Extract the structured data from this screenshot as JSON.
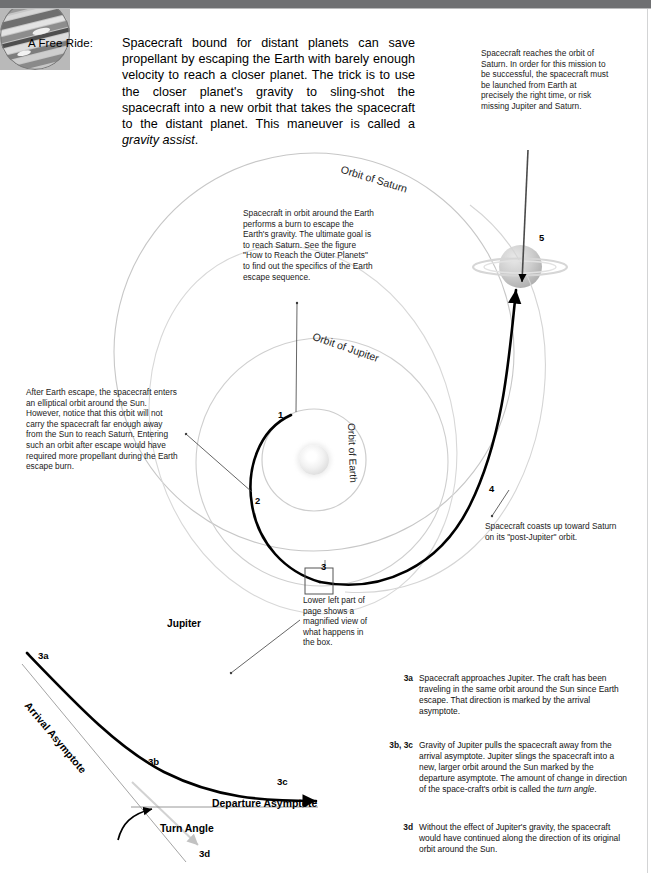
{
  "intro": {
    "label": "A Free Ride:",
    "body_before_em": "Spacecraft bound for distant planets can save propellant by escaping the Earth with barely enough velocity to reach a closer planet. The trick is to use the closer planet's gravity to sling-shot the spacecraft into a new orbit that takes the spacecraft to the distant planet. This maneuver is called a ",
    "body_em": "gravity assist",
    "body_after_em": "."
  },
  "callouts": {
    "saturn_arrival": "Spacecraft reaches the orbit of Saturn. In order for this mission to be successful, the spacecraft must be launched from Earth at precisely the right time, or risk missing Jupiter and Saturn.",
    "earth_escape": "Spacecraft in orbit around the Earth performs a burn to escape the Earth's gravity. The ultimate goal is to reach Saturn. See the figure \"How to Reach the Outer Planets\" to find out the specifics of the Earth escape sequence.",
    "elliptical_orbit": "After Earth escape, the spacecraft enters an elliptical orbit around the Sun. However, notice that this orbit will not carry the spacecraft far enough away from the Sun to reach Saturn. Entering such an orbit after escape would have required more propellant during the Earth escape burn.",
    "post_jupiter_coast": "Spacecraft coasts up toward Saturn on its \"post-Jupiter\" orbit.",
    "magnified_box": "Lower left part of page shows a magnified view of what happens in the box."
  },
  "orbit_labels": {
    "saturn": "Orbit of Saturn",
    "jupiter": "Orbit of Jupiter",
    "earth": "Orbit of Earth"
  },
  "markers": {
    "m1": "1",
    "m2": "2",
    "m3": "3",
    "m4": "4",
    "m5": "5"
  },
  "magnified": {
    "jupiter_caption": "Jupiter",
    "label_3a": "3a",
    "label_3b": "3b",
    "label_3c": "3c",
    "label_3d": "3d",
    "arrival_asymptote": "Arrival Asymptote",
    "departure_asymptote": "Departure Asymptote",
    "turn_angle": "Turn Angle"
  },
  "notes": [
    {
      "tag": "3a",
      "text": "Spacecraft approaches Jupiter. The craft has been traveling in the same orbit around the Sun since Earth escape. That direction is marked by the arrival asymptote."
    },
    {
      "tag": "3b, 3c",
      "text_before_em": "Gravity of Jupiter pulls the spacecraft away from the arrival asymptote. Jupiter slings the spacecraft into a new, larger orbit around the Sun marked by the departure asymptote. The amount of change in direction of the space-craft's orbit is called the ",
      "text_em": "turn angle",
      "text_after_em": "."
    },
    {
      "tag": "3d",
      "text": "Without the effect of Jupiter's gravity, the spacecraft would have continued along the direction of its original orbit around the Sun."
    }
  ],
  "colors": {
    "header_bar": "#6f7072",
    "trajectory": "#000000",
    "orbit_line": "#c9c9c9",
    "leader_line": "#4d4d4d",
    "page_background": "#ffffff"
  }
}
